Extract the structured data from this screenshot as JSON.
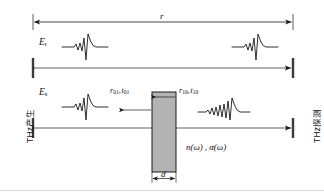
{
  "figure": {
    "canvas": {
      "width": 324,
      "height": 196,
      "background": "#ffffff"
    },
    "colors": {
      "line": "#1a1a1a",
      "sample_fill": "#b3b3b3",
      "sample_stroke": "#1a1a1a",
      "baseline_rule": "#d8d8d8",
      "text": "#111111"
    },
    "labels": {
      "thz_generation": "THz产生",
      "thz_detection": "THz探测",
      "path_length": "r",
      "field_reference": {
        "symbol": "E",
        "subscript": "r"
      },
      "field_sample": {
        "symbol": "E",
        "subscript": "s"
      },
      "fresnel_front": {
        "reflection": "r",
        "reflection_sub": "01",
        "transmission": "t",
        "transmission_sub": "01",
        "separator": ","
      },
      "fresnel_back": {
        "reflection": "r",
        "reflection_sub": "10",
        "transmission": "t",
        "transmission_sub": "10",
        "separator": ","
      },
      "optical_constants": "n(ω) , α(ω)",
      "thickness": "d"
    },
    "elements": {
      "top_dimension_arrow": {
        "name": "path-length-dimension",
        "x1": 33,
        "x2": 293,
        "y": 22,
        "double_headed": true
      },
      "ray_reference": {
        "name": "reference-beam-path",
        "x1": 33,
        "x2": 293,
        "y": 68,
        "arrow": "right"
      },
      "ray_sample": {
        "name": "sample-beam-path",
        "x1": 33,
        "x2": 293,
        "y": 128,
        "arrow": "right"
      },
      "emitter_aperture_top": {
        "x": 33,
        "y1": 58,
        "y2": 78
      },
      "emitter_aperture_bottom": {
        "x": 33,
        "y1": 118,
        "y2": 138
      },
      "detector_aperture_top": {
        "x": 293,
        "y1": 58,
        "y2": 78
      },
      "detector_aperture_bottom": {
        "x": 293,
        "y1": 118,
        "y2": 138
      },
      "sample_block": {
        "x": 152,
        "y": 92,
        "width": 24,
        "height": 80
      },
      "internal_reflection_arrow": {
        "x1": 174,
        "x2": 155,
        "y": 97,
        "direction": "left"
      },
      "external_reflection_arrow": {
        "x1": 150,
        "x2": 122,
        "y": 110,
        "direction": "left"
      },
      "thickness_dimension": {
        "x1": 152,
        "x2": 176,
        "y": 178,
        "double_headed": true
      }
    },
    "waveforms": [
      {
        "name": "reference-pulse-incident",
        "x": 62,
        "y": 47,
        "kind": "thz-pulse"
      },
      {
        "name": "reference-pulse-detected",
        "x": 232,
        "y": 47,
        "kind": "thz-pulse"
      },
      {
        "name": "sample-pulse-incident",
        "x": 62,
        "y": 107,
        "kind": "thz-pulse"
      },
      {
        "name": "sample-pulse-transmitted",
        "x": 200,
        "y": 110,
        "kind": "thz-pulse-dispersed"
      }
    ]
  }
}
